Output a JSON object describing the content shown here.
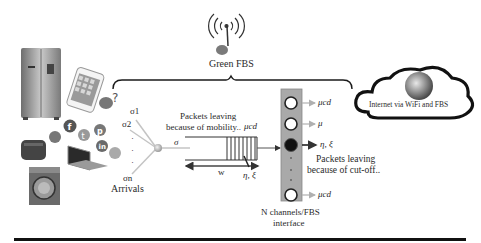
{
  "diagram": {
    "fbs": {
      "label": "Green FBS",
      "icon": "wireless-antenna-icon"
    },
    "cloud": {
      "label": "Internet via WiFi and FBS",
      "icon": "globe-icon"
    },
    "devices": [
      {
        "name": "refrigerator",
        "icon": "refrigerator-icon"
      },
      {
        "name": "smartphone",
        "icon": "smartphone-icon"
      },
      {
        "name": "toaster",
        "icon": "toaster-icon"
      },
      {
        "name": "laptop",
        "icon": "laptop-icon"
      },
      {
        "name": "washing-machine",
        "icon": "washing-machine-icon"
      }
    ],
    "social_icons": [
      "skype",
      "facebook",
      "twitter",
      "pinterest",
      "linkedin",
      "rss"
    ],
    "arrivals": {
      "sigma_1": "σ1",
      "sigma_2": "σ2",
      "sigma_n": "σn",
      "dots": "·",
      "label": "Arrivals"
    },
    "queue": {
      "input_rate": "σ",
      "mobility_label_line1": "Packets leaving",
      "mobility_label_line2": "because of mobility..",
      "mobility_rate": "μcd",
      "width_label": "w",
      "eta_xi": "η, ξ"
    },
    "channels": {
      "outputs": [
        {
          "rate": "μcd",
          "state": "idle"
        },
        {
          "rate": "μ",
          "state": "idle"
        },
        {
          "rate": "η, ξ",
          "state": "busy"
        },
        {
          "rate": "μcd",
          "state": "idle"
        }
      ],
      "cutoff_line1": "Packets leaving",
      "cutoff_line2": "because of cut-off..",
      "label_line1": "N channels/FBS",
      "label_line2": "interface"
    },
    "colors": {
      "ink": "#1a1a1a",
      "channel_panel": "#a8a8a8",
      "arrow_gray": "#b5b5b5",
      "busy_dot": "#111111"
    }
  }
}
